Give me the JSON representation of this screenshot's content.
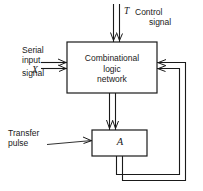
{
  "diagram": {
    "background_color": "#ffffff",
    "line_color": "#1a1a1a",
    "blocks": [
      {
        "id": "combinational-logic-network",
        "label_lines": [
          "Combinational",
          "logic",
          "network"
        ],
        "line1": "Combinational",
        "line2": "logic",
        "line3": "network",
        "x": 67,
        "y": 42,
        "width": 90,
        "height": 51
      },
      {
        "id": "register-a",
        "label": "A",
        "x": 92,
        "y": 130,
        "width": 55,
        "height": 26
      }
    ],
    "labels": {
      "control_signal_symbol": "T",
      "control_signal_line1": "Control",
      "control_signal_line2": "signal",
      "serial_input_line1": "Serial",
      "serial_input_line2": "input",
      "x_signal_symbol": "X",
      "x_signal_word": "signal",
      "transfer_pulse_line1": "Transfer",
      "transfer_pulse_line2": "pulse"
    },
    "connections": [
      {
        "id": "control-input-arrow",
        "style": "double-line",
        "from": "top-edge",
        "to": "combinational-logic-network",
        "direction": "down"
      },
      {
        "id": "serial-input-arrow",
        "style": "double-line",
        "from": "left-edge",
        "to": "combinational-logic-network",
        "direction": "right"
      },
      {
        "id": "cln-to-a-arrow",
        "style": "double-line",
        "from": "combinational-logic-network",
        "to": "register-a",
        "direction": "down"
      },
      {
        "id": "transfer-pulse-arrow",
        "style": "single-line",
        "from": "left-edge",
        "to": "register-a",
        "direction": "right"
      },
      {
        "id": "feedback-loop",
        "style": "double-line",
        "from": "register-a",
        "to": "combinational-logic-network",
        "direction": "left-into-right-edge"
      }
    ]
  }
}
